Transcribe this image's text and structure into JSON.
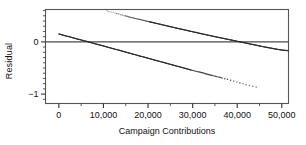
{
  "chart_data": {
    "type": "scatter",
    "title": "",
    "xlabel": "Campaign Contributions",
    "ylabel": "Residual",
    "xlim": [
      -3000,
      51500
    ],
    "ylim": [
      -1.18,
      0.62
    ],
    "grid": false,
    "legend": null,
    "xticks": [
      0,
      10000,
      20000,
      30000,
      40000,
      50000
    ],
    "xticklabels": [
      "0",
      "10,000",
      "20,000",
      "30,000",
      "40,000",
      "50,000"
    ],
    "xminor_step": 5000,
    "yticks": [
      0,
      -1
    ],
    "yticklabels": [
      "0",
      "-1"
    ],
    "yminor_step": 0.1,
    "reference_lines": [
      {
        "name": "zero-residual-line",
        "orientation": "horizontal",
        "y": 0,
        "color": "#4a4a4a"
      }
    ],
    "series": [
      {
        "name": "upper-band",
        "description": "Descending band of residual points entering at top of frame",
        "color": "#2b2b2b",
        "x_start": 10800,
        "x_end": 51500,
        "y_start": 0.6,
        "y_end": -0.16,
        "points": [
          {
            "x": 10800,
            "y": 0.595
          },
          {
            "x": 11400,
            "y": 0.575
          },
          {
            "x": 12200,
            "y": 0.565
          },
          {
            "x": 13000,
            "y": 0.545
          },
          {
            "x": 13900,
            "y": 0.52
          },
          {
            "x": 14800,
            "y": 0.5
          },
          {
            "x": 15700,
            "y": 0.48
          },
          {
            "x": 16600,
            "y": 0.462
          },
          {
            "x": 17500,
            "y": 0.442
          },
          {
            "x": 18400,
            "y": 0.425
          },
          {
            "x": 19300,
            "y": 0.405
          },
          {
            "x": 20200,
            "y": 0.388
          },
          {
            "x": 21100,
            "y": 0.37
          },
          {
            "x": 22000,
            "y": 0.352
          },
          {
            "x": 22900,
            "y": 0.334
          },
          {
            "x": 23800,
            "y": 0.316
          },
          {
            "x": 24700,
            "y": 0.298
          },
          {
            "x": 25600,
            "y": 0.28
          },
          {
            "x": 26500,
            "y": 0.262
          },
          {
            "x": 27400,
            "y": 0.245
          },
          {
            "x": 28300,
            "y": 0.228
          },
          {
            "x": 29200,
            "y": 0.21
          },
          {
            "x": 30100,
            "y": 0.193
          },
          {
            "x": 31000,
            "y": 0.176
          },
          {
            "x": 31900,
            "y": 0.158
          },
          {
            "x": 32800,
            "y": 0.142
          },
          {
            "x": 33700,
            "y": 0.125
          },
          {
            "x": 34600,
            "y": 0.108
          },
          {
            "x": 35500,
            "y": 0.092
          },
          {
            "x": 36400,
            "y": 0.076
          },
          {
            "x": 37300,
            "y": 0.06
          },
          {
            "x": 38200,
            "y": 0.044
          },
          {
            "x": 39100,
            "y": 0.028
          },
          {
            "x": 40000,
            "y": 0.012
          },
          {
            "x": 40900,
            "y": -0.004
          },
          {
            "x": 41800,
            "y": -0.02
          },
          {
            "x": 42700,
            "y": -0.036
          },
          {
            "x": 43600,
            "y": -0.052
          },
          {
            "x": 44500,
            "y": -0.068
          },
          {
            "x": 45400,
            "y": -0.084
          },
          {
            "x": 46300,
            "y": -0.099
          },
          {
            "x": 47200,
            "y": -0.114
          },
          {
            "x": 48100,
            "y": -0.128
          },
          {
            "x": 49000,
            "y": -0.142
          },
          {
            "x": 49900,
            "y": -0.154
          },
          {
            "x": 50800,
            "y": -0.163
          },
          {
            "x": 51500,
            "y": -0.168
          }
        ]
      },
      {
        "name": "lower-band",
        "description": "Descending band of residual points starting at left axis, thinning to sparse dots at right",
        "color": "#2b2b2b",
        "x_start": 0,
        "x_end": 45000,
        "y_start": 0.155,
        "y_end": -0.88,
        "points": [
          {
            "x": 0,
            "y": 0.152
          },
          {
            "x": 900,
            "y": 0.13
          },
          {
            "x": 1800,
            "y": 0.11
          },
          {
            "x": 2700,
            "y": 0.09
          },
          {
            "x": 3600,
            "y": 0.068
          },
          {
            "x": 4500,
            "y": 0.048
          },
          {
            "x": 5400,
            "y": 0.028
          },
          {
            "x": 6300,
            "y": 0.008
          },
          {
            "x": 7200,
            "y": -0.013
          },
          {
            "x": 8100,
            "y": -0.034
          },
          {
            "x": 9000,
            "y": -0.055
          },
          {
            "x": 9900,
            "y": -0.076
          },
          {
            "x": 10800,
            "y": -0.097
          },
          {
            "x": 11700,
            "y": -0.118
          },
          {
            "x": 12600,
            "y": -0.139
          },
          {
            "x": 13500,
            "y": -0.16
          },
          {
            "x": 14400,
            "y": -0.181
          },
          {
            "x": 15300,
            "y": -0.202
          },
          {
            "x": 16200,
            "y": -0.223
          },
          {
            "x": 17100,
            "y": -0.244
          },
          {
            "x": 18000,
            "y": -0.266
          },
          {
            "x": 18900,
            "y": -0.287
          },
          {
            "x": 19800,
            "y": -0.308
          },
          {
            "x": 20700,
            "y": -0.329
          },
          {
            "x": 21600,
            "y": -0.35
          },
          {
            "x": 22500,
            "y": -0.371
          },
          {
            "x": 23400,
            "y": -0.392
          },
          {
            "x": 24300,
            "y": -0.413
          },
          {
            "x": 25200,
            "y": -0.434
          },
          {
            "x": 26100,
            "y": -0.455
          },
          {
            "x": 27000,
            "y": -0.476
          },
          {
            "x": 27900,
            "y": -0.497
          },
          {
            "x": 28800,
            "y": -0.518
          },
          {
            "x": 29700,
            "y": -0.539
          },
          {
            "x": 30600,
            "y": -0.558
          },
          {
            "x": 31500,
            "y": -0.578
          },
          {
            "x": 32400,
            "y": -0.598
          },
          {
            "x": 33300,
            "y": -0.618
          },
          {
            "x": 34200,
            "y": -0.64
          },
          {
            "x": 35400,
            "y": -0.664
          },
          {
            "x": 36600,
            "y": -0.69
          },
          {
            "x": 37800,
            "y": -0.718
          },
          {
            "x": 39200,
            "y": -0.752
          },
          {
            "x": 40600,
            "y": -0.786
          },
          {
            "x": 42000,
            "y": -0.82
          },
          {
            "x": 43500,
            "y": -0.852
          },
          {
            "x": 45000,
            "y": -0.88
          }
        ]
      }
    ]
  }
}
